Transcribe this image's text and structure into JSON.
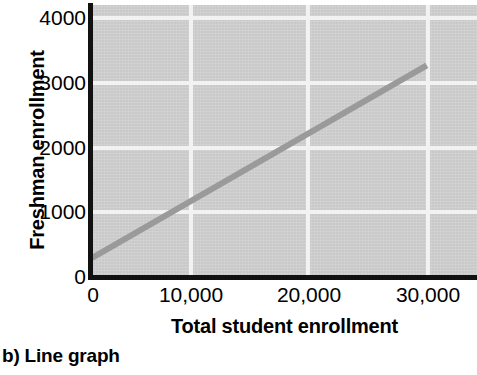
{
  "figure": {
    "caption": "b) Line graph"
  },
  "chart_data": {
    "type": "line",
    "title": "",
    "xlabel": "Total student enrollment",
    "ylabel": "Freshman enrollment",
    "xlim": [
      0,
      34500
    ],
    "ylim": [
      0,
      4150
    ],
    "grid": true,
    "legend": "none",
    "x_ticks": [
      {
        "value": 0,
        "label": "0"
      },
      {
        "value": 10000,
        "label": "10,000"
      },
      {
        "value": 20000,
        "label": "20,000"
      },
      {
        "value": 30000,
        "label": "30,000"
      }
    ],
    "y_ticks": [
      {
        "value": 0,
        "label": "0"
      },
      {
        "value": 1000,
        "label": "1000"
      },
      {
        "value": 2000,
        "label": "2000"
      },
      {
        "value": 3000,
        "label": "3000"
      },
      {
        "value": 4000,
        "label": "4000"
      }
    ],
    "series": [
      {
        "name": "Freshman enrollment trend",
        "color": "#9a9a9a",
        "line_width": 6,
        "x": [
          0,
          30000
        ],
        "values": [
          290,
          3230
        ]
      }
    ],
    "plot_background_color": "#c9c9c9",
    "gridline_color": "#f2f2f2",
    "axis_color": "#111111"
  }
}
